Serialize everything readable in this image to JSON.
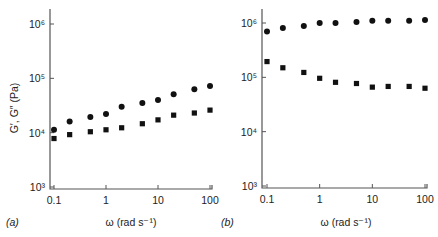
{
  "chart_data": [
    {
      "type": "scatter",
      "panel_label": "(a)",
      "title": "",
      "xlabel": "ω (rad s⁻¹)",
      "ylabel": "G′, G″ (Pa)",
      "xscale": "log",
      "yscale": "log",
      "xlim": [
        0.1,
        100
      ],
      "ylim": [
        1000,
        1000000
      ],
      "xticks": [
        "0.1",
        "1",
        "10",
        "100"
      ],
      "yticks": [
        "10³",
        "10⁴",
        "10⁵",
        "10⁶"
      ],
      "grid": false,
      "legend": "none",
      "x": [
        0.1,
        0.2,
        0.5,
        1,
        2,
        5,
        10,
        20,
        50,
        100
      ],
      "series": [
        {
          "name": "G′ (circles)",
          "marker": "circle",
          "values": [
            11300,
            16000,
            19500,
            22000,
            30000,
            35000,
            40000,
            51000,
            63000,
            72000
          ]
        },
        {
          "name": "G″ (squares)",
          "marker": "square",
          "values": [
            7800,
            9200,
            10400,
            11300,
            12300,
            14600,
            17200,
            21000,
            23000,
            26000
          ]
        }
      ]
    },
    {
      "type": "scatter",
      "panel_label": "(b)",
      "title": "",
      "xlabel": "ω (rad s⁻¹)",
      "ylabel": "",
      "xscale": "log",
      "yscale": "log",
      "xlim": [
        0.1,
        100
      ],
      "ylim": [
        1000,
        1000000
      ],
      "xticks": [
        "0.1",
        "1",
        "10",
        "100"
      ],
      "yticks": [
        "10³",
        "10⁴",
        "10⁵",
        "10⁶"
      ],
      "grid": false,
      "legend": "none",
      "x": [
        0.1,
        0.2,
        0.5,
        1,
        2,
        5,
        10,
        20,
        50,
        100
      ],
      "series": [
        {
          "name": "G′ (circles)",
          "marker": "circle",
          "values": [
            700000,
            810000,
            880000,
            1000000,
            1000000,
            1040000,
            1100000,
            1100000,
            1100000,
            1130000
          ]
        },
        {
          "name": "G″ (squares)",
          "marker": "square",
          "values": [
            195000,
            150000,
            123000,
            96000,
            81000,
            77000,
            66000,
            68000,
            68000,
            63000
          ]
        }
      ]
    }
  ],
  "labels": {
    "panel_a": "(a)",
    "panel_b": "(b)",
    "ylabel": "G′, G″ (Pa)",
    "xlabel_a": "ω (rad s⁻¹)",
    "xlabel_b": "ω (rad s⁻¹)",
    "xticks": [
      "0.1",
      "1",
      "10",
      "100"
    ]
  },
  "colors": {
    "marker": "#111111",
    "axis": "#555555"
  }
}
